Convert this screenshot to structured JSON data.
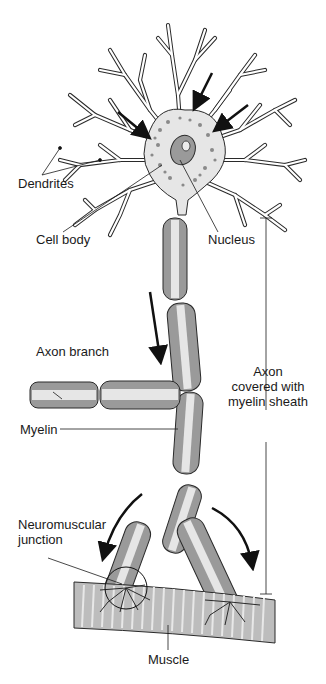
{
  "diagram": {
    "type": "anatomy",
    "labels": {
      "dendrites": "Dendrites",
      "cell_body": "Cell body",
      "nucleus": "Nucleus",
      "axon_branch": "Axon branch",
      "myelin": "Myelin",
      "axon_line1": "Axon",
      "axon_line2": "covered with",
      "axon_line3": "myelin sheath",
      "nmj_line1": "Neuromuscular",
      "nmj_line2": "junction",
      "muscle": "Muscle"
    },
    "colors": {
      "outline": "#2a2a2a",
      "cytoplasm": "#e6e6e6",
      "myelin": "#9a9a9a",
      "muscle": "#bdbdbd",
      "muscle_stripe": "#e8e8e8",
      "arrow": "#111111"
    }
  }
}
